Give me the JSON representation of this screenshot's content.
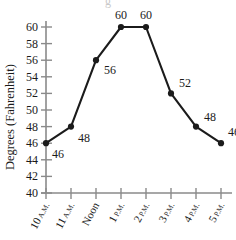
{
  "chart_data": {
    "type": "line",
    "title": "",
    "xlabel": "",
    "ylabel": "Degrees (Fahrenheit)",
    "categories": [
      "10 A.M.",
      "11 A.M.",
      "Noon",
      "1 P.M.",
      "2 P.M.",
      "3 P.M.",
      "4 P.M.",
      "5 P.M."
    ],
    "values": [
      46,
      48,
      56,
      60,
      60,
      52,
      48,
      46
    ],
    "point_labels": [
      "46",
      "48",
      "56",
      "60",
      "60",
      "52",
      "48",
      "46"
    ],
    "ylim": [
      40,
      60
    ],
    "ytick_step": 2,
    "yticks": [
      "60",
      "58",
      "56",
      "54",
      "52",
      "50",
      "48",
      "46",
      "44",
      "42",
      "40"
    ],
    "grid": false,
    "legend": "none",
    "colors": {
      "line": "#1b1b1b",
      "marker": "#1b1b1b",
      "axis": "#8a8a8a",
      "text": "#1b1b1b"
    }
  },
  "axis": {
    "y_title": "Degrees (Fahrenheit)"
  },
  "ticks": {
    "x": [
      {
        "num": "10",
        "ampm": "A.M."
      },
      {
        "num": "11",
        "ampm": "A.M."
      },
      {
        "num": "Noon",
        "ampm": ""
      },
      {
        "num": "1",
        "ampm": "P.M."
      },
      {
        "num": "2",
        "ampm": "P.M."
      },
      {
        "num": "3",
        "ampm": "P.M."
      },
      {
        "num": "4",
        "ampm": "P.M."
      },
      {
        "num": "5",
        "ampm": "P.M."
      }
    ]
  }
}
